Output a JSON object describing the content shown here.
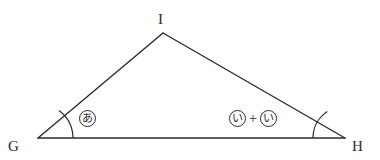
{
  "figure": {
    "type": "triangle-angle-diagram",
    "background_color": "#ffffff",
    "stroke_color": "#2b2b2b",
    "vertices": {
      "G": {
        "label": "G",
        "x": 38,
        "y": 138
      },
      "H": {
        "label": "H",
        "x": 345,
        "y": 138
      },
      "I": {
        "label": "I",
        "x": 163,
        "y": 33
      }
    },
    "sides": [
      {
        "name": "GH",
        "from": "G",
        "to": "H"
      },
      {
        "name": "GI",
        "from": "G",
        "to": "I"
      },
      {
        "name": "IH",
        "from": "I",
        "to": "H"
      }
    ],
    "angle_marks": [
      {
        "at": "G",
        "arc": true,
        "expression": "circled-a"
      },
      {
        "at": "H",
        "arc": true,
        "expression": "circled-i-plus-circled-i"
      }
    ],
    "annotations": {
      "left_angle": {
        "name": "angle-G-expression",
        "terms": [
          {
            "kind": "circled",
            "text": "あ"
          }
        ]
      },
      "right_angle": {
        "name": "angle-H-expression",
        "terms": [
          {
            "kind": "circled",
            "text": "い"
          },
          {
            "kind": "operator",
            "text": "+"
          },
          {
            "kind": "circled",
            "text": "い"
          }
        ]
      }
    }
  }
}
